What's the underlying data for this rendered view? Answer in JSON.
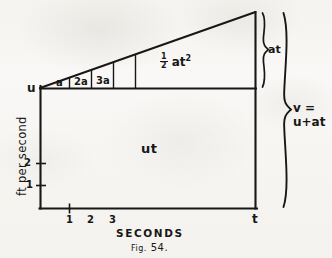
{
  "figure": {
    "caption_prefix": "Fig.",
    "caption_number": "54.",
    "caption_full": "FIG. 54."
  },
  "axes": {
    "y_title": "ft per second",
    "y_ticks": [
      {
        "label": "2"
      },
      {
        "label": "1"
      }
    ],
    "x_title": "SECONDS",
    "x_ticks": [
      {
        "label": "1"
      },
      {
        "label": "2"
      },
      {
        "label": "3"
      }
    ],
    "x_end_label": "t",
    "y_start_label": "u"
  },
  "regions": {
    "rectangle_label": "ut",
    "triangle_label_fraction_num": "1",
    "triangle_label_fraction_den": "2",
    "triangle_label_body": "at",
    "triangle_label_exponent": "2",
    "triangle_label_full": "½ at²"
  },
  "strips": [
    {
      "label": "a"
    },
    {
      "label": "2a"
    },
    {
      "label": "3a"
    }
  ],
  "braces": {
    "small": {
      "label": "at"
    },
    "large": {
      "line1": "v =",
      "line2": "u+at"
    }
  },
  "colors": {
    "ink": "#171717",
    "paper": "#f7f7f4"
  }
}
